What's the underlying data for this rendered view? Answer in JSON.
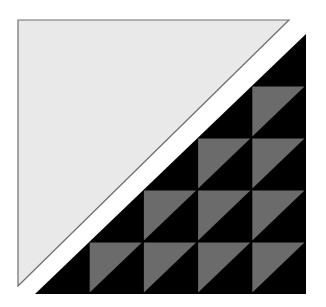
{
  "canvas": {
    "width": 326,
    "height": 307,
    "background": "#ffffff"
  },
  "colors": {
    "light_fill": "#e9e9e9",
    "light_stroke": "#6e6e6e",
    "dark_fill": "#000000",
    "mid_fill": "#6b6b6b"
  },
  "light_triangle": {
    "points": [
      [
        18,
        20
      ],
      [
        289,
        20
      ],
      [
        18,
        286
      ]
    ]
  },
  "grid": {
    "x0": 35,
    "y0": 34,
    "cols": 5,
    "rows": 5,
    "cell_w": 54.2,
    "cell_h": 52,
    "rule": "cells where col+row == 4 are black lower-right half-triangles; cells where col+row > 4 are split squares: gray upper-left triangle, black lower-right triangle"
  }
}
